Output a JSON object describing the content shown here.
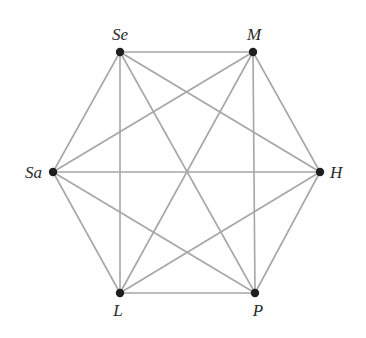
{
  "diagram": {
    "type": "complete-graph",
    "name": "K6",
    "edge_color": "#a6a6a6",
    "node_color": "#1f1f1f",
    "nodes": [
      {
        "id": "Se",
        "label": "Se",
        "x": 120,
        "y": 52,
        "lx": 120,
        "ly": 40,
        "anchor": "middle"
      },
      {
        "id": "M",
        "label": "M",
        "x": 253,
        "y": 52,
        "lx": 254,
        "ly": 40,
        "anchor": "middle"
      },
      {
        "id": "Sa",
        "label": "Sa",
        "x": 53,
        "y": 172,
        "lx": 42,
        "ly": 178,
        "anchor": "end"
      },
      {
        "id": "H",
        "label": "H",
        "x": 320,
        "y": 172,
        "lx": 330,
        "ly": 178,
        "anchor": "start"
      },
      {
        "id": "L",
        "label": "L",
        "x": 120,
        "y": 293,
        "lx": 118,
        "ly": 316,
        "anchor": "middle"
      },
      {
        "id": "P",
        "label": "P",
        "x": 255,
        "y": 293,
        "lx": 258,
        "ly": 316,
        "anchor": "middle"
      }
    ],
    "edges": [
      [
        "Se",
        "M"
      ],
      [
        "Se",
        "Sa"
      ],
      [
        "Se",
        "H"
      ],
      [
        "Se",
        "L"
      ],
      [
        "Se",
        "P"
      ],
      [
        "M",
        "Sa"
      ],
      [
        "M",
        "H"
      ],
      [
        "M",
        "L"
      ],
      [
        "M",
        "P"
      ],
      [
        "Sa",
        "H"
      ],
      [
        "Sa",
        "L"
      ],
      [
        "Sa",
        "P"
      ],
      [
        "H",
        "L"
      ],
      [
        "H",
        "P"
      ],
      [
        "L",
        "P"
      ]
    ]
  }
}
